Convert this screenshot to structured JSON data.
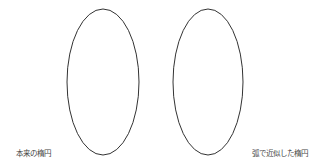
{
  "figure": {
    "ellipses": [
      {
        "id": "original",
        "cx": 103,
        "cy": 82,
        "rx": 36,
        "ry": 73,
        "stroke": "#333333"
      },
      {
        "id": "arc-approx",
        "cx": 208,
        "cy": 82,
        "rx": 35,
        "ry": 73,
        "stroke": "#333333"
      }
    ],
    "labels": {
      "left": "本来の楕円",
      "right": "弧で近似した楕円"
    }
  }
}
